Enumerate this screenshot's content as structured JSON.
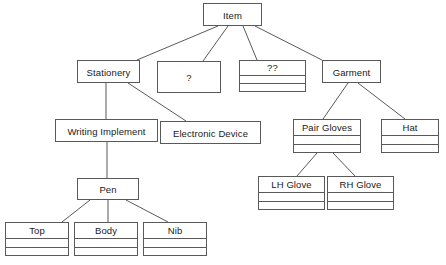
{
  "diagram": {
    "type": "class-hierarchy-tree",
    "background_color": "#ffffff",
    "line_color": "#595959",
    "text_color": "#1a1a1a",
    "nodes": [
      {
        "id": "item",
        "label": "Item",
        "compartments": 1,
        "x": 203,
        "y": 3,
        "w": 59,
        "h": 23,
        "name_height": 23
      },
      {
        "id": "stationery",
        "label": "Stationery",
        "compartments": 1,
        "x": 77,
        "y": 60,
        "w": 63,
        "h": 23,
        "name_height": 23
      },
      {
        "id": "unknown-one",
        "label": "?",
        "compartments": 1,
        "x": 157,
        "y": 61,
        "w": 64,
        "h": 32,
        "name_height": 32
      },
      {
        "id": "unknown-two",
        "label": "??",
        "compartments": 3,
        "x": 239,
        "y": 60,
        "w": 67,
        "h": 32,
        "name_height": 15
      },
      {
        "id": "garment",
        "label": "Garment",
        "compartments": 1,
        "x": 322,
        "y": 60,
        "w": 59,
        "h": 23,
        "name_height": 23
      },
      {
        "id": "writing-implement",
        "label": "Writing Implement",
        "compartments": 1,
        "x": 55,
        "y": 119,
        "w": 103,
        "h": 23,
        "name_height": 23
      },
      {
        "id": "electronic-device",
        "label": "Electronic Device",
        "compartments": 1,
        "x": 160,
        "y": 121,
        "w": 101,
        "h": 23,
        "name_height": 23
      },
      {
        "id": "pair-gloves",
        "label": "Pair Gloves",
        "compartments": 3,
        "x": 293,
        "y": 119,
        "w": 68,
        "h": 34,
        "name_height": 16
      },
      {
        "id": "hat",
        "label": "Hat",
        "compartments": 3,
        "x": 381,
        "y": 119,
        "w": 58,
        "h": 34,
        "name_height": 16
      },
      {
        "id": "pen",
        "label": "Pen",
        "compartments": 1,
        "x": 77,
        "y": 178,
        "w": 62,
        "h": 22,
        "name_height": 22
      },
      {
        "id": "lh-glove",
        "label": "LH Glove",
        "compartments": 3,
        "x": 258,
        "y": 176,
        "w": 67,
        "h": 34,
        "name_height": 16
      },
      {
        "id": "rh-glove",
        "label": "RH Glove",
        "compartments": 3,
        "x": 327,
        "y": 176,
        "w": 67,
        "h": 34,
        "name_height": 16
      },
      {
        "id": "top",
        "label": "Top",
        "compartments": 3,
        "x": 5,
        "y": 222,
        "w": 64,
        "h": 34,
        "name_height": 16
      },
      {
        "id": "body",
        "label": "Body",
        "compartments": 3,
        "x": 74,
        "y": 222,
        "w": 64,
        "h": 34,
        "name_height": 16
      },
      {
        "id": "nib",
        "label": "Nib",
        "compartments": 3,
        "x": 143,
        "y": 222,
        "w": 64,
        "h": 34,
        "name_height": 16
      }
    ],
    "edges": [
      {
        "id": "item-stationery",
        "from": "item",
        "to": "stationery",
        "points": "218,26 137,60"
      },
      {
        "id": "item-unknown-one",
        "from": "item",
        "to": "unknown-one",
        "points": "228,26 203,61"
      },
      {
        "id": "item-unknown-two",
        "from": "item",
        "to": "unknown-two",
        "points": "243,26 257,60"
      },
      {
        "id": "item-garment",
        "from": "item",
        "to": "garment",
        "points": "255,26 322,60"
      },
      {
        "id": "stationery-writing",
        "from": "stationery",
        "to": "writing-implement",
        "points": "106,83 106,119"
      },
      {
        "id": "stationery-electronic",
        "from": "stationery",
        "to": "electronic-device",
        "points": "128,83 186,121"
      },
      {
        "id": "garment-pair-gloves",
        "from": "garment",
        "to": "pair-gloves",
        "points": "348,83 323,119"
      },
      {
        "id": "garment-hat",
        "from": "garment",
        "to": "hat",
        "points": "358,83 405,119"
      },
      {
        "id": "writing-pen",
        "from": "writing-implement",
        "to": "pen",
        "points": "107,142 107,178"
      },
      {
        "id": "pair-gloves-lh",
        "from": "pair-gloves",
        "to": "lh-glove",
        "points": "317,153 297,176"
      },
      {
        "id": "pair-gloves-rh",
        "from": "pair-gloves",
        "to": "rh-glove",
        "points": "333,153 355,176"
      },
      {
        "id": "pen-top",
        "from": "pen",
        "to": "top",
        "points": "90,200 62,222"
      },
      {
        "id": "pen-body",
        "from": "pen",
        "to": "body",
        "points": "108,200 108,222"
      },
      {
        "id": "pen-nib",
        "from": "pen",
        "to": "nib",
        "points": "126,200 168,222"
      }
    ]
  }
}
